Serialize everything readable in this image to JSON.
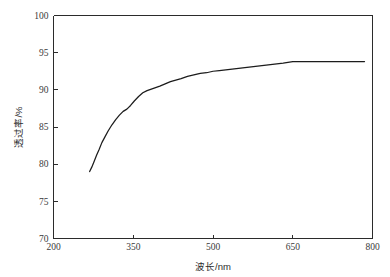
{
  "chart_data": {
    "type": "line",
    "title": "",
    "subtitle": "",
    "xlabel": "波长/nm",
    "ylabel": "透过率/%",
    "xlim": [
      200,
      800
    ],
    "ylim": [
      70,
      100
    ],
    "xticks": [
      200,
      350,
      500,
      650,
      800
    ],
    "yticks": [
      70,
      75,
      80,
      85,
      90,
      95,
      100
    ],
    "xtick_labels": [
      "200",
      "350",
      "500",
      "650",
      "800"
    ],
    "ytick_labels": [
      "70",
      "75",
      "80",
      "85",
      "90",
      "95",
      "100"
    ],
    "grid": false,
    "legend": null,
    "legend_position": "none",
    "series": [
      {
        "name": "透过率",
        "color": "#1c1c1c",
        "x": [
          268,
          272,
          276,
          281,
          286,
          291,
          297,
          303,
          310,
          317,
          324,
          331,
          338,
          345,
          352,
          360,
          368,
          376,
          384,
          392,
          400,
          410,
          420,
          430,
          440,
          452,
          464,
          476,
          488,
          500,
          512,
          524,
          536,
          548,
          560,
          572,
          584,
          596,
          608,
          620,
          632,
          650,
          680,
          710,
          740,
          785
        ],
        "y": [
          79.0,
          79.6,
          80.3,
          81.2,
          82.0,
          82.9,
          83.7,
          84.5,
          85.3,
          86.0,
          86.6,
          87.1,
          87.4,
          87.9,
          88.5,
          89.1,
          89.6,
          89.9,
          90.1,
          90.3,
          90.5,
          90.8,
          91.1,
          91.3,
          91.5,
          91.8,
          92.0,
          92.2,
          92.3,
          92.5,
          92.6,
          92.7,
          92.8,
          92.9,
          93.0,
          93.1,
          93.2,
          93.3,
          93.4,
          93.5,
          93.6,
          93.8,
          93.8,
          93.8,
          93.8,
          93.8
        ]
      }
    ],
    "annotations": []
  },
  "axes": {
    "x_axis_name": "wavelength-axis",
    "y_axis_name": "transmittance-axis"
  }
}
